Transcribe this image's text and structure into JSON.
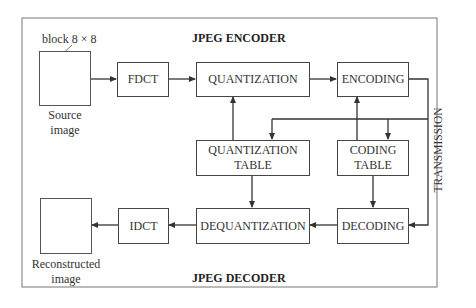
{
  "diagram": {
    "encoder_title": "JPEG ENCODER",
    "decoder_title": "JPEG DECODER",
    "source": {
      "block_label": "block 8 × 8",
      "label_line1": "Source",
      "label_line2": "image"
    },
    "reconstructed": {
      "label_line1": "Reconstructed",
      "label_line2": "image"
    },
    "blocks": {
      "fdct": "FDCT",
      "quantization": "QUANTIZATION",
      "encoding": "ENCODING",
      "quantization_table_line1": "QUANTIZATION",
      "quantization_table_line2": "TABLE",
      "coding_table_line1": "CODING",
      "coding_table_line2": "TABLE",
      "dequantization": "DEQUANTIZATION",
      "decoding": "DECODING",
      "idct": "IDCT"
    },
    "transmission_label": "TRANSMISSION",
    "edges": [
      [
        "Source image",
        "FDCT"
      ],
      [
        "FDCT",
        "QUANTIZATION"
      ],
      [
        "QUANTIZATION",
        "ENCODING"
      ],
      [
        "QUANTIZATION TABLE",
        "QUANTIZATION"
      ],
      [
        "CODING TABLE",
        "ENCODING"
      ],
      [
        "ENCODING",
        "DECODING (TRANSMISSION)"
      ],
      [
        "TRANSMISSION",
        "QUANTIZATION TABLE"
      ],
      [
        "TRANSMISSION",
        "CODING TABLE"
      ],
      [
        "QUANTIZATION TABLE",
        "DEQUANTIZATION"
      ],
      [
        "CODING TABLE",
        "DECODING"
      ],
      [
        "DECODING",
        "DEQUANTIZATION"
      ],
      [
        "DEQUANTIZATION",
        "IDCT"
      ],
      [
        "IDCT",
        "Reconstructed image"
      ]
    ]
  }
}
